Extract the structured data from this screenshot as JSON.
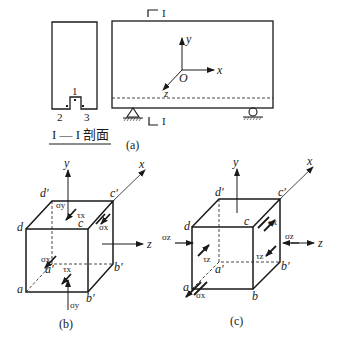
{
  "figure_a": {
    "caption": "(a)",
    "section_marker_top": "I",
    "section_marker_bottom": "I",
    "section_title": "I — I 剖面",
    "cross_section_points": {
      "p1": "1",
      "p2": "2",
      "p3": "3"
    },
    "axes": {
      "x": "x",
      "y": "y",
      "z": "z",
      "origin": "O"
    }
  },
  "figure_b": {
    "caption": "(b)",
    "axes": {
      "x": "x",
      "y": "y",
      "z": "z"
    },
    "vertices": {
      "a": "a",
      "d": "d",
      "d_prime": "d′",
      "c": "c",
      "c_prime": "c′",
      "a_prime": "a′",
      "b_prime_back": "b′",
      "b_prime_front": "b′"
    },
    "stresses": {
      "sigma_y_top": "σy",
      "tau_x_top": "τx",
      "sigma_x_right": "σx",
      "sigma_x_left": "σx",
      "tau_x_bottom": "τx",
      "sigma_y_bottom": "σy"
    }
  },
  "figure_c": {
    "caption": "(c)",
    "axes": {
      "x": "x",
      "y": "y",
      "z": "z"
    },
    "vertices": {
      "a": "a",
      "b": "b",
      "c": "c",
      "d": "d",
      "a_prime": "a′",
      "b_prime": "b′",
      "c_prime": "c′",
      "d_prime": "d′"
    },
    "stresses": {
      "sigma_z_left": "σz",
      "tau_z_front": "τz",
      "sigma_x_top": "σx",
      "sigma_z_right": "σz",
      "tau_z_right": "τz",
      "sigma_x_bottom": "σx"
    }
  }
}
